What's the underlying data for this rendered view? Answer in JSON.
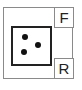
{
  "diagram": {
    "outer_box": {
      "border_color": "#8a8a8a"
    },
    "labels": [
      {
        "id": "front",
        "text": "F"
      },
      {
        "id": "rear",
        "text": "R"
      }
    ],
    "die": {
      "face_value": 3,
      "pip_color": "#111111",
      "pips": [
        {
          "x": 25,
          "y": 37
        },
        {
          "x": 38,
          "y": 45
        },
        {
          "x": 24,
          "y": 52
        }
      ]
    }
  }
}
